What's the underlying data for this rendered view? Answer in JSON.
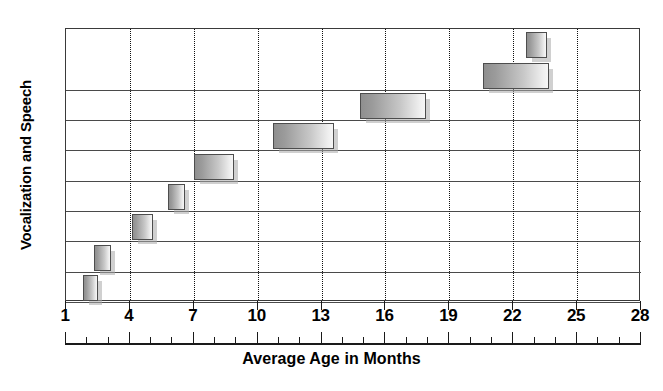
{
  "chart_data": {
    "type": "bar",
    "orientation": "horizontal-range",
    "title": "",
    "xlabel": "Average Age in Months",
    "ylabel": "Vocalization and Speech",
    "xlim": [
      1,
      28
    ],
    "xticks": [
      1,
      4,
      7,
      10,
      13,
      16,
      19,
      22,
      25,
      28
    ],
    "xtick_labels": [
      "1",
      "4",
      "7",
      "10",
      "13",
      "16",
      "19",
      "22",
      "25",
      "28"
    ],
    "minor_tick_interval": 1,
    "grid": "vertical dotted gridlines at major ticks",
    "legend": "none",
    "row_count": 9,
    "bars": [
      {
        "index": 1,
        "row": 1,
        "start": 1.8,
        "end": 2.5
      },
      {
        "index": 2,
        "row": 2,
        "start": 2.3,
        "end": 3.1
      },
      {
        "index": 3,
        "row": 3,
        "start": 4.1,
        "end": 5.1
      },
      {
        "index": 4,
        "row": 4,
        "start": 5.8,
        "end": 6.6
      },
      {
        "index": 5,
        "row": 5,
        "start": 7.0,
        "end": 8.9
      },
      {
        "index": 6,
        "row": 6,
        "start": 10.7,
        "end": 13.6
      },
      {
        "index": 7,
        "row": 7,
        "start": 14.8,
        "end": 17.9
      },
      {
        "index": 8,
        "row": 8,
        "start": 20.6,
        "end": 23.7
      },
      {
        "index": 9,
        "row": 9,
        "start": 22.6,
        "end": 23.6
      }
    ]
  },
  "axis": {
    "x_title": "Average Age in Months",
    "y_title": "Vocalization and Speech",
    "tick_labels": [
      "1",
      "4",
      "7",
      "10",
      "13",
      "16",
      "19",
      "22",
      "25",
      "28"
    ]
  },
  "colors": {
    "bar_fill_dark": "#8f8f8f",
    "bar_fill_light": "#f6f6f6",
    "bar_border": "#4d4d4d",
    "shadow": "#aaaaaa",
    "frame": "#3a3a3a",
    "gridline": "#111111",
    "text": "#000000",
    "background": "#ffffff"
  }
}
